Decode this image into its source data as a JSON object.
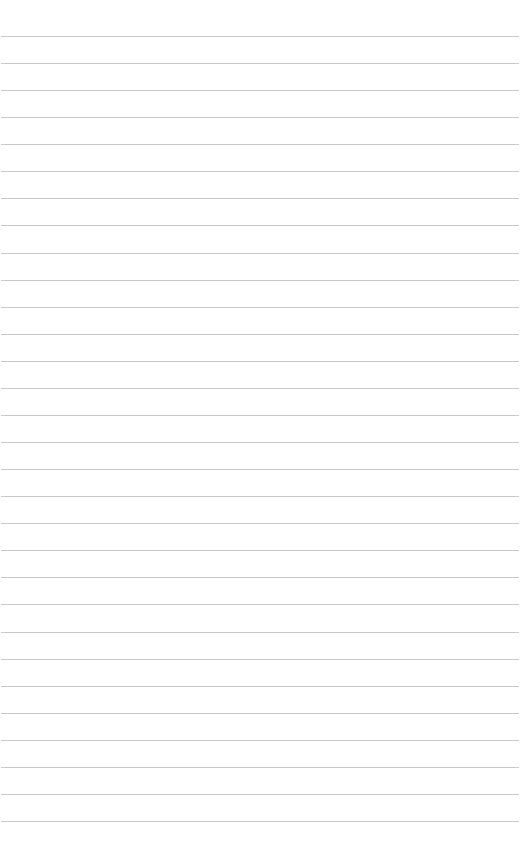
{
  "page": {
    "type": "lined-paper",
    "background_color": "#ffffff",
    "line_color": "#c9c9c9",
    "line_count": 30,
    "first_line_y": 36,
    "line_spacing": 27.07
  }
}
